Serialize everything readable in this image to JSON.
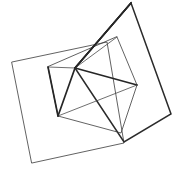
{
  "figure": {
    "background_color": "#ffffff",
    "width": 173,
    "height": 180,
    "stroke_color_thin": "#3a3a3a",
    "stroke_color_thick": "#262626"
  },
  "chart_data": {
    "type": "scatter",
    "xlabel": "",
    "ylabel": "",
    "xlim": [
      0,
      173
    ],
    "ylim": [
      0,
      180
    ],
    "grid": false,
    "legend": "none",
    "shapes": [
      {
        "name": "outer-square",
        "style": "thin",
        "closed": true,
        "points": [
          [
            12,
            62
          ],
          [
            107,
            42
          ],
          [
            124,
            143
          ],
          [
            32,
            163
          ]
        ]
      },
      {
        "name": "tilted-quad",
        "style": "thick",
        "closed": true,
        "points": [
          [
            131,
            3
          ],
          [
            171,
            114
          ],
          [
            124,
            142
          ],
          [
            75,
            68
          ]
        ]
      },
      {
        "name": "inner-quad",
        "style": "thin",
        "closed": true,
        "points": [
          [
            117,
            37
          ],
          [
            137,
            85
          ],
          [
            121,
            133
          ],
          [
            58,
            116
          ],
          [
            48,
            67
          ]
        ]
      }
    ],
    "segments": [
      {
        "name": "hub-to-top-apex",
        "style": "thick",
        "from": [
          75,
          68
        ],
        "to": [
          131,
          3
        ]
      },
      {
        "name": "hub-to-right-vertex",
        "style": "thick",
        "from": [
          75,
          68
        ],
        "to": [
          137,
          85
        ]
      },
      {
        "name": "hub-to-lower-left",
        "style": "thick",
        "from": [
          75,
          68
        ],
        "to": [
          58,
          116
        ]
      },
      {
        "name": "hub-to-inner-left",
        "style": "thin",
        "from": [
          75,
          68
        ],
        "to": [
          48,
          67
        ]
      },
      {
        "name": "hub-to-inner-top",
        "style": "thin",
        "from": [
          75,
          68
        ],
        "to": [
          117,
          37
        ]
      },
      {
        "name": "lower-left-to-right-vertex",
        "style": "thin",
        "from": [
          58,
          116
        ],
        "to": [
          137,
          85
        ]
      },
      {
        "name": "lower-left-to-inner-left",
        "style": "thick",
        "from": [
          58,
          116
        ],
        "to": [
          48,
          67
        ]
      },
      {
        "name": "top-apex-to-left-edge",
        "style": "thick",
        "from": [
          131,
          3
        ],
        "to": [
          75,
          68
        ]
      }
    ],
    "vertices": [
      {
        "name": "hub",
        "x": 75,
        "y": 68
      },
      {
        "name": "top-apex",
        "x": 131,
        "y": 3
      },
      {
        "name": "right-vertex",
        "x": 171,
        "y": 114
      },
      {
        "name": "bottom-right",
        "x": 124,
        "y": 142
      },
      {
        "name": "bottom-left",
        "x": 32,
        "y": 163
      },
      {
        "name": "top-left",
        "x": 12,
        "y": 62
      },
      {
        "name": "inner-top",
        "x": 117,
        "y": 37
      },
      {
        "name": "inner-right",
        "x": 137,
        "y": 85
      },
      {
        "name": "inner-bottom",
        "x": 121,
        "y": 133
      },
      {
        "name": "inner-lower-left",
        "x": 58,
        "y": 116
      },
      {
        "name": "inner-left",
        "x": 48,
        "y": 67
      }
    ]
  }
}
